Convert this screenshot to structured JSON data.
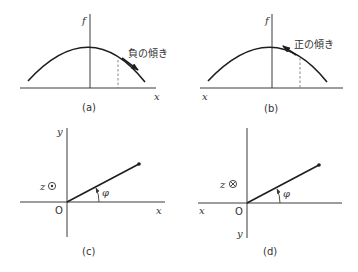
{
  "panels": {
    "a": {
      "caption": "(a)",
      "y_axis_label": "f",
      "x_axis_label": "x",
      "slope_label": "負の傾き",
      "slope_sign": "negative"
    },
    "b": {
      "caption": "(b)",
      "y_axis_label": "f",
      "x_axis_label": "x",
      "slope_label": "正の傾き",
      "slope_sign": "positive"
    },
    "c": {
      "caption": "(c)",
      "x_axis_label": "x",
      "y_axis_label": "y",
      "origin_label": "O",
      "z_label": "z",
      "z_symbol": "⊙",
      "angle_label": "φ"
    },
    "d": {
      "caption": "(d)",
      "x_axis_label": "x",
      "y_axis_label": "y",
      "origin_label": "O",
      "z_label": "z",
      "z_symbol": "⊗",
      "angle_label": "φ"
    }
  },
  "colors": {
    "line": "#1e1e1e",
    "axis": "#3a3a3a",
    "dashed": "#7a7a7a",
    "background": "#ffffff"
  }
}
